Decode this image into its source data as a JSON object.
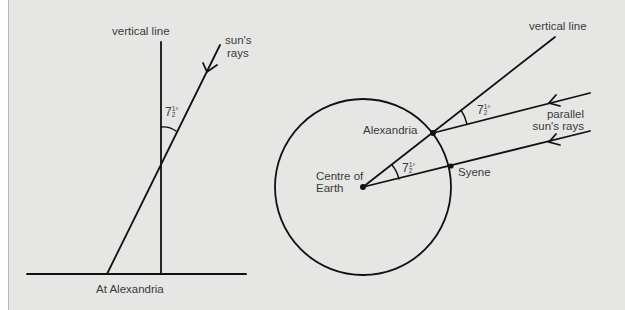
{
  "figure": {
    "background_color": "#e6e6e4",
    "line_color": "#111111",
    "text_color": "#3a3a3a"
  },
  "left_diagram": {
    "caption": "At Alexandria",
    "vertical_label": "vertical line",
    "rays_label_line1": "sun's",
    "rays_label_line2": "rays",
    "angle": {
      "whole": "7",
      "num": "1",
      "den": "2",
      "unit": "°"
    }
  },
  "right_diagram": {
    "vertical_label": "vertical line",
    "alexandria_label": "Alexandria",
    "syene_label": "Syene",
    "centre_label_line1": "Centre of",
    "centre_label_line2": "Earth",
    "rays_label_line1": "parallel",
    "rays_label_line2": "sun's rays",
    "angle_top": {
      "whole": "7",
      "num": "1",
      "den": "2",
      "unit": "°"
    },
    "angle_centre": {
      "whole": "7",
      "num": "1",
      "den": "2",
      "unit": "°"
    }
  }
}
